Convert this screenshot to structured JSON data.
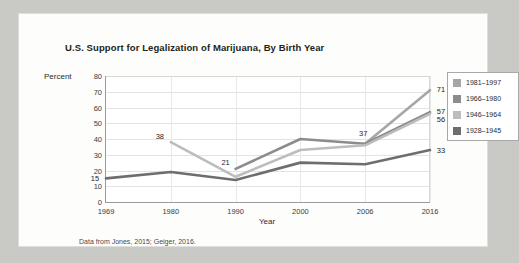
{
  "chart_data": {
    "type": "line",
    "title": "U.S. Support for Legalization of Marijuana, By Birth Year",
    "xlabel": "Year",
    "ylabel": "Percent",
    "x": [
      1969,
      1980,
      1990,
      2000,
      2006,
      2016
    ],
    "xticks": [
      "1969",
      "1980",
      "1990",
      "2000",
      "2006",
      "2016"
    ],
    "yticks": [
      "0",
      "10",
      "20",
      "30",
      "40",
      "50",
      "60",
      "70",
      "80"
    ],
    "ylim": [
      0,
      80
    ],
    "grid": true,
    "legend_position": "right",
    "series": [
      {
        "name": "1981–1997",
        "color": "#a6a6a6",
        "values": [
          null,
          null,
          null,
          null,
          37,
          71
        ],
        "labels": [
          null,
          null,
          null,
          null,
          null,
          "71"
        ]
      },
      {
        "name": "1966–1980",
        "color": "#8c8c8c",
        "values": [
          null,
          null,
          21,
          40,
          37,
          57
        ],
        "labels": [
          null,
          null,
          "21",
          null,
          "37",
          "57"
        ]
      },
      {
        "name": "1946–1964",
        "color": "#bdbdbd",
        "values": [
          null,
          38,
          16,
          33,
          36,
          56
        ],
        "labels": [
          null,
          "38",
          null,
          null,
          null,
          "56"
        ]
      },
      {
        "name": "1928–1945",
        "color": "#6e6e6e",
        "values": [
          15,
          19,
          14,
          25,
          24,
          33
        ],
        "labels": [
          "15",
          null,
          null,
          null,
          null,
          "33"
        ]
      }
    ],
    "footnote": "Data from Jones, 2015; Geiger, 2016."
  }
}
